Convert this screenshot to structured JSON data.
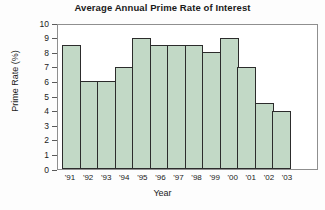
{
  "chart_data": {
    "type": "bar",
    "title": "Average Annual Prime Rate of Interest",
    "xlabel": "Year",
    "ylabel": "Prime Rate (%)",
    "categories": [
      "'91",
      "'92",
      "'93",
      "'94",
      "'95",
      "'96",
      "'97",
      "'98",
      "'99",
      "'00",
      "'01",
      "'02",
      "'03"
    ],
    "values": [
      8.5,
      6.0,
      6.0,
      7.0,
      9.0,
      8.5,
      8.5,
      8.5,
      8.0,
      9.0,
      7.0,
      4.5,
      4.0
    ],
    "ylim": [
      0,
      10
    ],
    "ytick_labels": [
      "0",
      "1",
      "2",
      "3",
      "4",
      "5",
      "6",
      "7",
      "8",
      "9",
      "10"
    ],
    "ytick_values": [
      0,
      1,
      2,
      3,
      4,
      5,
      6,
      7,
      8,
      9,
      10
    ],
    "grid": false,
    "legend": null,
    "bar_fill_color": "#c2d9c6",
    "bar_edge_color": "#2c2c2c",
    "frame_color": "#8f8f8f",
    "background_color": "#fdfdfd",
    "text_color": "#1a1a1a"
  }
}
